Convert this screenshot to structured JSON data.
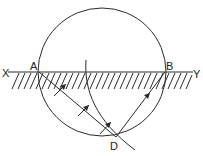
{
  "diagram": {
    "labels": {
      "x": "X",
      "y": "Y",
      "a": "A",
      "b": "B",
      "d": "D"
    },
    "colors": {
      "ink": "#2a2a2a",
      "background": "#ffffff"
    },
    "elements": {
      "circle": {
        "cx": 102,
        "cy": 72,
        "r": 64
      },
      "surface_line": {
        "from": "X",
        "to": "Y",
        "y": 72
      },
      "ray_a_to_d": {
        "from": "A",
        "to": "D"
      },
      "ray_d_to_b": {
        "from": "D",
        "to": "B"
      },
      "wavefront_curve": "arc from near top-center through D region",
      "arrows": 4
    }
  }
}
